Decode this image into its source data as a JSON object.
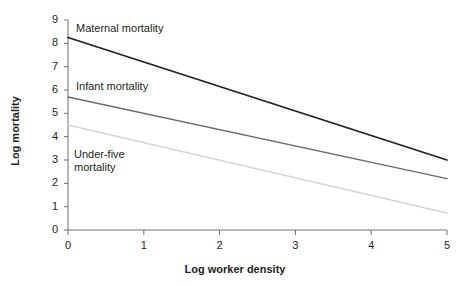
{
  "chart_data": {
    "type": "line",
    "title": "",
    "subtitle": "",
    "xlabel": "Log worker density",
    "ylabel": "Log mortality",
    "xlim": [
      0,
      5
    ],
    "ylim": [
      0,
      9
    ],
    "xticks": [
      0,
      1,
      2,
      3,
      4,
      5
    ],
    "yticks": [
      0,
      1,
      2,
      3,
      4,
      5,
      6,
      7,
      8,
      9
    ],
    "xtick_labels": [
      "0",
      "1",
      "2",
      "3",
      "4",
      "5"
    ],
    "ytick_labels": [
      "0",
      "1",
      "2",
      "3",
      "4",
      "5",
      "6",
      "7",
      "8",
      "9"
    ],
    "grid": false,
    "legend_position": "inline-annotations",
    "series": [
      {
        "name": "Maternal mortality",
        "label": "Maternal mortality",
        "color": "#231f20",
        "line_width": 1.8,
        "x": [
          0,
          5
        ],
        "values": [
          8.25,
          3.0
        ]
      },
      {
        "name": "Infant mortality",
        "label": "Infant mortality",
        "color": "#6b6b6b",
        "line_width": 1.4,
        "x": [
          0,
          5
        ],
        "values": [
          5.7,
          2.2
        ]
      },
      {
        "name": "Under-five mortality",
        "label": "Under-five\nmortality",
        "color": "#d4d4d4",
        "line_width": 1.6,
        "x": [
          0,
          5
        ],
        "values": [
          4.5,
          0.73
        ]
      }
    ],
    "annotations": [
      {
        "text": "Maternal mortality",
        "x": 0.18,
        "y": 8.75
      },
      {
        "text": "Infant mortality",
        "x": 0.18,
        "y": 6.25
      },
      {
        "text": "Under-five\nmortality",
        "x": 0.15,
        "y": 3.4
      }
    ],
    "axis_color": "#6f6f6f"
  }
}
